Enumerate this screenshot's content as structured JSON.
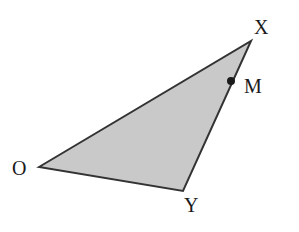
{
  "diagram": {
    "type": "triangle",
    "fill_color": "#c8c8c8",
    "stroke_color": "#333333",
    "vertices": {
      "O": {
        "label": "O",
        "x": 39,
        "y": 167
      },
      "X": {
        "label": "X",
        "x": 251,
        "y": 41
      },
      "Y": {
        "label": "Y",
        "x": 183,
        "y": 191
      }
    },
    "points": {
      "M": {
        "label": "M",
        "x": 231,
        "y": 81,
        "on_segment": "XY"
      }
    },
    "labels": {
      "O": "O",
      "X": "X",
      "Y": "Y",
      "M": "M"
    }
  }
}
